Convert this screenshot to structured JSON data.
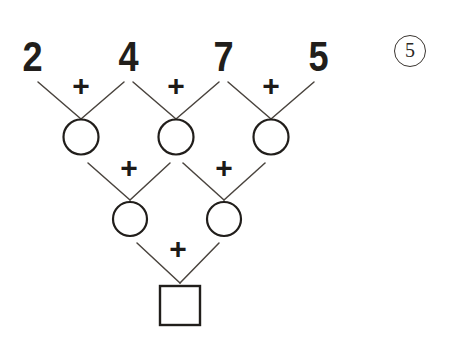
{
  "worksheet": {
    "problem_number": "5",
    "operator_symbol": "+",
    "top_numbers": [
      "2",
      "4",
      "7",
      "5"
    ],
    "row2_cells": [
      "",
      "",
      ""
    ],
    "row3_cells": [
      "",
      ""
    ],
    "answer_cell": "",
    "colors": {
      "ink": "#211e1b",
      "line": "#4a443e",
      "background": "#ffffff",
      "badge_border": "#3a3530"
    }
  },
  "layout": {
    "top_row_plus_labels": [
      "+",
      "+",
      "+"
    ],
    "row2_plus_labels": [
      "+",
      "+"
    ],
    "row3_plus_labels": [
      "+"
    ]
  }
}
